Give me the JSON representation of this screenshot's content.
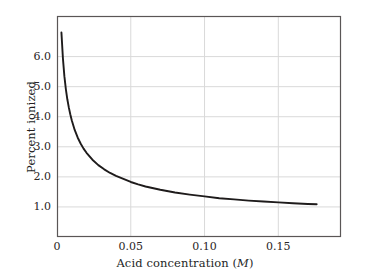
{
  "figure": {
    "background_color": "#ffffff",
    "frame_color": "#5a5656",
    "grid_color": "#d9d9d9",
    "curve_color": "#1e1b1b",
    "text_color": "#241f1f"
  },
  "chart_data": {
    "type": "line",
    "title": "",
    "xlabel": "Acid concentration (M)",
    "xlabel_plain": "Acid concentration (",
    "xlabel_unit": "M",
    "xlabel_close": ")",
    "ylabel": "Percent ionized",
    "xlim": [
      0,
      0.1925
    ],
    "ylim": [
      0.0,
      7.35
    ],
    "grid": true,
    "legend": null,
    "xticks": [
      0,
      0.05,
      0.1,
      0.15
    ],
    "xticklabels": [
      "0",
      "0.05",
      "0.10",
      "0.15"
    ],
    "yticks": [
      1.0,
      2.0,
      3.0,
      4.0,
      5.0,
      6.0
    ],
    "yticklabels": [
      "1.0",
      "2.0",
      "3.0",
      "4.0",
      "5.0",
      "6.0"
    ],
    "series": [
      {
        "name": "percent ionized",
        "x": [
          0.003,
          0.004,
          0.005,
          0.006,
          0.007,
          0.008,
          0.009,
          0.01,
          0.012,
          0.014,
          0.016,
          0.018,
          0.02,
          0.024,
          0.028,
          0.032,
          0.036,
          0.04,
          0.045,
          0.05,
          0.055,
          0.06,
          0.07,
          0.08,
          0.09,
          0.1,
          0.11,
          0.12,
          0.13,
          0.14,
          0.15,
          0.16,
          0.17,
          0.176
        ],
        "y": [
          6.8,
          5.95,
          5.35,
          4.92,
          4.58,
          4.31,
          4.08,
          3.88,
          3.56,
          3.31,
          3.11,
          2.94,
          2.8,
          2.57,
          2.39,
          2.25,
          2.13,
          2.03,
          1.93,
          1.83,
          1.75,
          1.68,
          1.57,
          1.48,
          1.41,
          1.35,
          1.29,
          1.25,
          1.21,
          1.18,
          1.15,
          1.12,
          1.1,
          1.09
        ]
      }
    ]
  },
  "axes_geometry": {
    "left": 57,
    "right": 341,
    "top": 16,
    "bottom": 237
  }
}
